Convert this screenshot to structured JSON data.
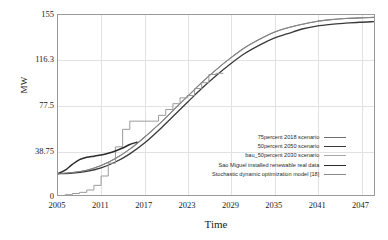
{
  "chart_data": {
    "type": "line",
    "title": "",
    "xlabel": "Time",
    "ylabel": "MW",
    "xlim": [
      2005,
      2049
    ],
    "ylim": [
      0,
      155
    ],
    "grid": true,
    "legend_position": "inside lower-right",
    "xticks": [
      "2005",
      "2011",
      "2017",
      "2023",
      "2029",
      "2035",
      "2041",
      "2047"
    ],
    "xtick_values": [
      2005,
      2011,
      2017,
      2023,
      2029,
      2035,
      2041,
      2047
    ],
    "yticks": [
      "0",
      "38.75",
      "77.5",
      "116.3",
      "155"
    ],
    "ytick_values": [
      0,
      38.75,
      77.5,
      116.3,
      155
    ],
    "series": [
      {
        "name": "75percent 2018 scenario",
        "color": "#6e6e6e",
        "width": 1.1,
        "style": "smooth",
        "x": [
          2005,
          2007,
          2009,
          2011,
          2013,
          2015,
          2017,
          2019,
          2021,
          2023,
          2025,
          2027,
          2029,
          2031,
          2033,
          2035,
          2037,
          2039,
          2041,
          2043,
          2045,
          2047,
          2049
        ],
        "y": [
          19,
          20,
          22,
          26,
          32,
          40,
          50,
          61,
          73,
          85,
          97,
          108,
          118,
          127,
          134,
          140,
          144,
          147,
          149.5,
          151,
          152,
          152.5,
          153
        ]
      },
      {
        "name": "50percent 2050 scenario",
        "color": "#3a3a3a",
        "width": 1.3,
        "style": "smooth",
        "x": [
          2005,
          2007,
          2009,
          2011,
          2013,
          2015,
          2017,
          2019,
          2021,
          2023,
          2025,
          2027,
          2029,
          2031,
          2033,
          2035,
          2037,
          2039,
          2041,
          2043,
          2045,
          2047,
          2049
        ],
        "y": [
          19,
          19.5,
          21,
          24,
          29,
          36,
          45,
          56,
          68,
          80,
          92,
          103,
          113,
          122,
          129,
          135,
          139,
          143,
          145.5,
          147,
          148,
          148.8,
          149.3
        ]
      },
      {
        "name": "bau_50percent 2030 scenario",
        "color": "#9b9b9b",
        "width": 1.0,
        "style": "step",
        "x": [
          2005,
          2006,
          2007,
          2008,
          2009,
          2010,
          2011,
          2012,
          2013,
          2014,
          2015,
          2016,
          2017,
          2018,
          2019,
          2020,
          2021,
          2022,
          2023,
          2024,
          2025,
          2026,
          2027,
          2028
        ],
        "y": [
          0,
          1,
          2,
          3,
          5,
          9,
          17,
          28,
          42,
          57,
          64,
          64,
          64,
          64,
          69,
          74,
          79,
          84,
          86,
          92,
          97,
          104,
          105,
          105
        ]
      },
      {
        "name": "Sao Miguel installed renewable real data",
        "color": "#2b2b2b",
        "width": 1.5,
        "style": "smooth",
        "x": [
          2005,
          2006,
          2007,
          2008,
          2009,
          2010,
          2011,
          2012,
          2013,
          2014,
          2015,
          2016
        ],
        "y": [
          19,
          22,
          27,
          31,
          33,
          34,
          35,
          36.5,
          38.5,
          41,
          44,
          46
        ]
      },
      {
        "name": "Stochastic dynamic optimization model [18]",
        "color": "#8a8a8a",
        "width": 0.9,
        "style": "smooth",
        "x": [
          2005,
          2007,
          2009,
          2011,
          2013,
          2015,
          2017,
          2019,
          2021,
          2023,
          2025,
          2027,
          2029,
          2031,
          2033,
          2035,
          2037,
          2039,
          2041,
          2043,
          2045,
          2047,
          2049
        ],
        "y": [
          19,
          20,
          22,
          26,
          32,
          40,
          50,
          61,
          73,
          85,
          97,
          108,
          118,
          127,
          134,
          140,
          144,
          147,
          149.5,
          151,
          152,
          152.5,
          153
        ]
      }
    ],
    "legend_entries": [
      {
        "label": "75percent 2018 scenario",
        "color": "#6e6e6e",
        "width": 1.1
      },
      {
        "label": "50percent 2050 scenario",
        "color": "#3a3a3a",
        "width": 1.6
      },
      {
        "label": "bau_50percent 2030 scenario",
        "color": "#a8a8a8",
        "width": 1.1
      },
      {
        "label": "Sao Miguel installed renewable real data",
        "color": "#2b2b2b",
        "width": 1.8
      },
      {
        "label": "Stochastic dynamic optimization model [18]",
        "color": "#8a8a8a",
        "width": 1.0
      }
    ]
  }
}
